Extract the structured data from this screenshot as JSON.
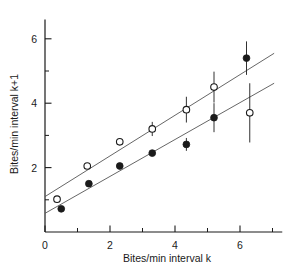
{
  "chart_data": {
    "type": "scatter",
    "title": "",
    "xlabel": "Bites/min interval k",
    "ylabel": "Bites/min interval k+1",
    "xlim": [
      0,
      7.3
    ],
    "ylim": [
      0,
      6.6
    ],
    "xticks": [
      0,
      2,
      4,
      6
    ],
    "xticklabels": [
      "0",
      "2",
      "4",
      "6"
    ],
    "xminorticks": [
      1,
      3,
      5,
      7
    ],
    "yticks": [
      2,
      4,
      6
    ],
    "yticklabels": [
      "2",
      "4",
      "6"
    ],
    "yminorticks": [
      1,
      3,
      5
    ],
    "grid": false,
    "legend": "none",
    "series": [
      {
        "name": "open-circles",
        "marker": "open-circle",
        "points": [
          {
            "x": 0.37,
            "y": 1.02,
            "yerr": 0.0
          },
          {
            "x": 1.3,
            "y": 2.05,
            "yerr": 0.0
          },
          {
            "x": 2.3,
            "y": 2.8,
            "yerr": 0.0
          },
          {
            "x": 3.3,
            "y": 3.2,
            "yerr": 0.22
          },
          {
            "x": 4.35,
            "y": 3.8,
            "yerr": 0.4
          },
          {
            "x": 5.2,
            "y": 4.5,
            "yerr": 0.48
          },
          {
            "x": 6.3,
            "y": 3.7,
            "yerr": 0.92
          }
        ],
        "fit_line": {
          "x0": 0.0,
          "y0": 1.1,
          "x1": 7.05,
          "y1": 5.55
        }
      },
      {
        "name": "filled-circles",
        "marker": "filled-circle",
        "points": [
          {
            "x": 0.5,
            "y": 0.72,
            "yerr": 0.0
          },
          {
            "x": 1.35,
            "y": 1.5,
            "yerr": 0.0
          },
          {
            "x": 2.3,
            "y": 2.05,
            "yerr": 0.0
          },
          {
            "x": 3.3,
            "y": 2.45,
            "yerr": 0.0
          },
          {
            "x": 4.35,
            "y": 2.72,
            "yerr": 0.2
          },
          {
            "x": 5.2,
            "y": 3.55,
            "yerr": 0.45
          },
          {
            "x": 6.2,
            "y": 5.4,
            "yerr": 0.52
          }
        ],
        "fit_line": {
          "x0": 0.0,
          "y0": 0.58,
          "x1": 7.05,
          "y1": 4.62
        }
      }
    ],
    "colors": {
      "ink": "#1a1a1a",
      "line": "#555555",
      "background": "#ffffff"
    }
  }
}
